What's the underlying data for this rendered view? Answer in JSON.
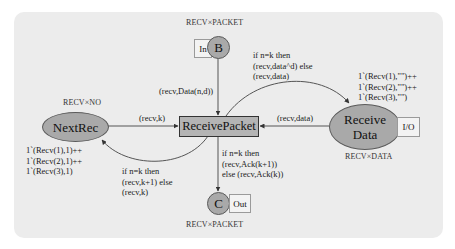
{
  "diagram": {
    "type": "coloured-petri-net",
    "places": {
      "b": {
        "label": "B",
        "type_label": "RECV×PACKET",
        "port": "In"
      },
      "c": {
        "label": "C",
        "type_label": "RECV×PACKET",
        "port": "Out"
      },
      "next_rec": {
        "label": "NextRec",
        "type_label": "RECV×NO",
        "initial_marking": [
          "1`(Recv(1),1)++",
          "1`(Recv(2),1)++",
          "1`(Recv(3),1)"
        ]
      },
      "receive_data": {
        "label_line1": "Receive",
        "label_line2": "Data",
        "type_label": "RECV×DATA",
        "port": "I/O",
        "initial_marking": [
          "1`(Recv(1),\"\")++",
          "1`(Recv(2),\"\")++",
          "1`(Recv(3),\"\")"
        ]
      }
    },
    "transitions": {
      "receive_packet": {
        "label": "ReceivePacket"
      }
    },
    "arcs": {
      "b_to_rp": {
        "inscription": "(recv,Data(n,d))"
      },
      "nextrec_to_rp": {
        "inscription": "(recv,k)"
      },
      "rp_to_nextrec": {
        "inscription": [
          "if n=k then",
          "(recv,k+1) else",
          "(recv,k)"
        ]
      },
      "rd_to_rp": {
        "inscription": "(recv,data)"
      },
      "rp_to_rd": {
        "inscription": [
          "if n=k then",
          "(recv,data^d) else",
          "(recv,data)"
        ]
      },
      "rp_to_c": {
        "inscription": [
          "if n=k then",
          "(recv,Ack(k+1))",
          "else (recv,Ack(k))"
        ]
      }
    },
    "colors": {
      "panel_bg": "#ececec",
      "place_fill": "#a9a9a9",
      "transition_fill": "#b4b4b4",
      "edge": "#555555"
    }
  }
}
